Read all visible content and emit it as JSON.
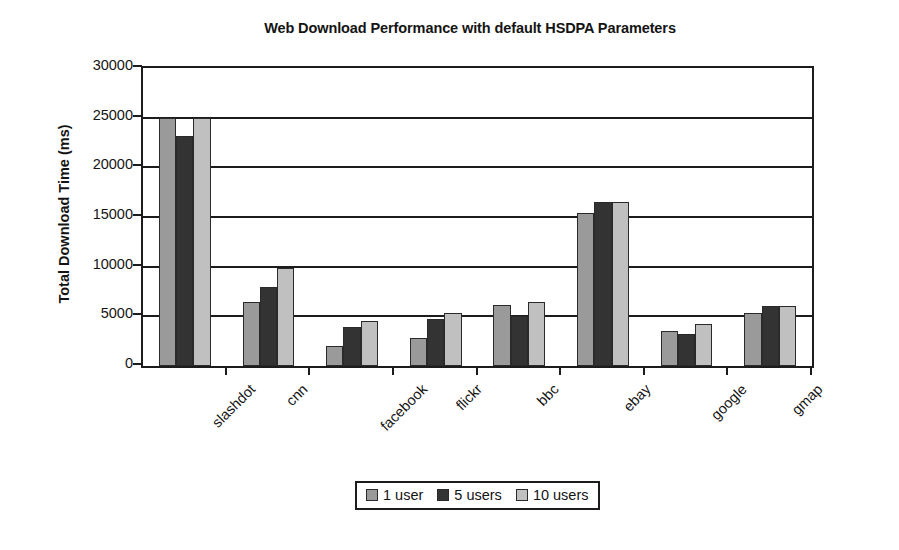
{
  "chart_data": {
    "type": "bar",
    "title": "Web Download Performance with default HSDPA Parameters",
    "xlabel": "",
    "ylabel": "Total Download Time (ms)",
    "ylim": [
      0,
      30000
    ],
    "ytick_step": 5000,
    "yticks": [
      "30000",
      "25000",
      "20000",
      "15000",
      "10000",
      "5000",
      "0"
    ],
    "ytick_values": [
      30000,
      25000,
      20000,
      15000,
      10000,
      5000,
      0
    ],
    "grid": true,
    "legend_position": "bottom",
    "categories": [
      "slashdot",
      "cnn",
      "facebook",
      "flickr",
      "bbc",
      "ebay",
      "google",
      "gmap"
    ],
    "series": [
      {
        "name": "1 user",
        "color": "#9a9a9a",
        "values": [
          25000,
          6400,
          2000,
          2800,
          6100,
          15400,
          3500,
          5300
        ]
      },
      {
        "name": "5 users",
        "color": "#333333",
        "values": [
          23200,
          8000,
          3900,
          4700,
          5000,
          16500,
          3200,
          6000
        ]
      },
      {
        "name": "10 users",
        "color": "#c0c0c0",
        "values": [
          25000,
          9900,
          4500,
          5300,
          6400,
          16500,
          4200,
          6000
        ]
      }
    ]
  },
  "legend": {
    "items": [
      {
        "label": "1 user",
        "color": "#9a9a9a",
        "icon": "square-swatch-icon"
      },
      {
        "label": "5 users",
        "color": "#333333",
        "icon": "square-swatch-icon"
      },
      {
        "label": "10 users",
        "color": "#c0c0c0",
        "icon": "square-swatch-icon"
      }
    ]
  },
  "colors": {
    "axis": "#1c1c1c",
    "text": "#141414",
    "background": "#ffffff"
  }
}
